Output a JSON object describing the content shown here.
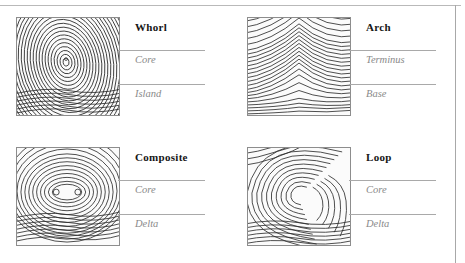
{
  "figure": {
    "name": "fingerprint-pattern-types",
    "frame_color": "#b9b9b9",
    "leader_color": "#a9a9a9",
    "title_color": "#161616",
    "callout_color": "#8a8a8a"
  },
  "panels": [
    {
      "id": "whorl",
      "title": "Whorl",
      "pattern": "whorl",
      "callouts": [
        "Core",
        "Island"
      ]
    },
    {
      "id": "arch",
      "title": "Arch",
      "pattern": "arch",
      "callouts": [
        "Terminus",
        "Base"
      ]
    },
    {
      "id": "composite",
      "title": "Composite",
      "pattern": "composite",
      "callouts": [
        "Core",
        "Delta"
      ]
    },
    {
      "id": "loop",
      "title": "Loop",
      "pattern": "loop",
      "callouts": [
        "Core",
        "Delta"
      ]
    }
  ]
}
